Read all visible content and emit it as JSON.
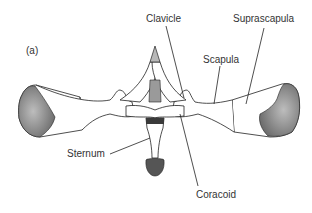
{
  "figure": {
    "panel_label": "(a)",
    "labels": {
      "clavicle": "Clavicle",
      "suprascapula": "Suprascapula",
      "scapula": "Scapula",
      "sternum": "Sternum",
      "coracoid": "Coracoid"
    },
    "colors": {
      "line": "#222222",
      "text": "#333333",
      "shade": "#8a8a8a",
      "dark": "#3a3a3a",
      "background": "#ffffff"
    }
  }
}
